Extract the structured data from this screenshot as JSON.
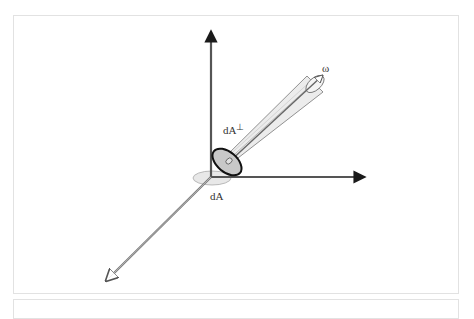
{
  "figure": {
    "labels": {
      "omega": "ω",
      "dA_perp": "dA",
      "dA_perp_sup": "⊥",
      "dA": "dA"
    },
    "colors": {
      "axis": "#555555",
      "arrowhead": "#1a1a1a",
      "cone_fill": "#e8e8e8",
      "ellipse_perp_fill": "#c8c8c8",
      "ellipse_perp_stroke": "#111111",
      "ellipse_flat_fill": "#e6e6e6",
      "frame": "#e2e2e2"
    },
    "axes": [
      {
        "name": "vertical-axis",
        "direction": "up"
      },
      {
        "name": "horizontal-axis",
        "direction": "right"
      },
      {
        "name": "depth-axis",
        "direction": "down-left"
      }
    ]
  }
}
